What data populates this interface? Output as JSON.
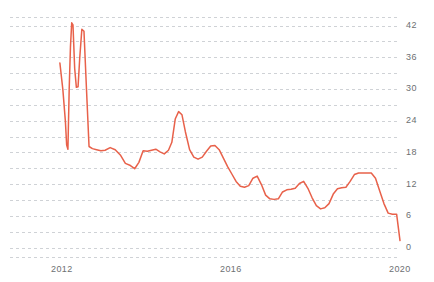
{
  "chart_data": {
    "type": "line",
    "title": "",
    "xlabel": "",
    "ylabel": "",
    "xlim": [
      2011.5,
      2020.2
    ],
    "ylim": [
      0,
      45
    ],
    "grid": true,
    "grid_style": "dashed-horizontal-minor",
    "grid_interval": 3,
    "legend": "none",
    "line_color": "#e8614a",
    "line_width": 1.5,
    "axis_label_color": "#6d6f72",
    "background": "#ffffff",
    "yticks": [
      0,
      6,
      12,
      18,
      24,
      30,
      36,
      42
    ],
    "ytick_labels": [
      "0",
      "6",
      "12",
      "18",
      "24",
      "30",
      "36",
      "42"
    ],
    "xticks": [
      2012,
      2016,
      2020
    ],
    "xtick_labels": [
      "2012",
      "2016",
      "2020"
    ],
    "series": [
      {
        "name": "value",
        "x": [
          2011.95,
          2012.02,
          2012.08,
          2012.11,
          2012.14,
          2012.17,
          2012.2,
          2012.23,
          2012.26,
          2012.3,
          2012.34,
          2012.38,
          2012.42,
          2012.47,
          2012.52,
          2012.58,
          2012.64,
          2012.72,
          2012.82,
          2012.92,
          2013.02,
          2013.14,
          2013.26,
          2013.38,
          2013.5,
          2013.62,
          2013.72,
          2013.82,
          2013.92,
          2014.02,
          2014.12,
          2014.22,
          2014.32,
          2014.42,
          2014.52,
          2014.6,
          2014.68,
          2014.76,
          2014.84,
          2014.92,
          2015.02,
          2015.12,
          2015.22,
          2015.32,
          2015.42,
          2015.52,
          2015.62,
          2015.72,
          2015.82,
          2015.92,
          2016.02,
          2016.12,
          2016.22,
          2016.32,
          2016.42,
          2016.52,
          2016.62,
          2016.72,
          2016.82,
          2016.92,
          2017.02,
          2017.12,
          2017.22,
          2017.32,
          2017.42,
          2017.52,
          2017.62,
          2017.72,
          2017.82,
          2017.92,
          2018.02,
          2018.12,
          2018.22,
          2018.32,
          2018.42,
          2018.52,
          2018.62,
          2018.72,
          2018.82,
          2018.92,
          2019.02,
          2019.12,
          2019.22,
          2019.32,
          2019.42,
          2019.52,
          2019.62,
          2019.72,
          2019.82,
          2019.92,
          2020.0
        ],
        "y": [
          35.0,
          30.0,
          24.0,
          19.5,
          18.7,
          30.0,
          38.0,
          42.6,
          42.2,
          34.0,
          30.4,
          30.5,
          36.0,
          41.4,
          41.0,
          30.0,
          19.2,
          18.8,
          18.6,
          18.4,
          18.5,
          19.0,
          18.6,
          17.6,
          16.0,
          15.6,
          15.0,
          16.2,
          18.4,
          18.3,
          18.5,
          18.7,
          18.2,
          17.8,
          18.5,
          20.0,
          24.4,
          25.8,
          25.2,
          22.0,
          18.6,
          17.2,
          16.8,
          17.2,
          18.3,
          19.3,
          19.4,
          18.6,
          17.0,
          15.4,
          14.0,
          12.6,
          11.7,
          11.5,
          11.8,
          13.2,
          13.6,
          12.0,
          10.0,
          9.3,
          9.2,
          9.3,
          10.6,
          11.0,
          11.1,
          11.3,
          12.2,
          12.6,
          11.3,
          9.5,
          8.0,
          7.4,
          7.6,
          8.4,
          10.2,
          11.2,
          11.4,
          11.5,
          12.6,
          13.9,
          14.2,
          14.2,
          14.2,
          14.2,
          13.2,
          10.8,
          8.4,
          6.6,
          6.4,
          6.4,
          1.4
        ]
      }
    ]
  }
}
